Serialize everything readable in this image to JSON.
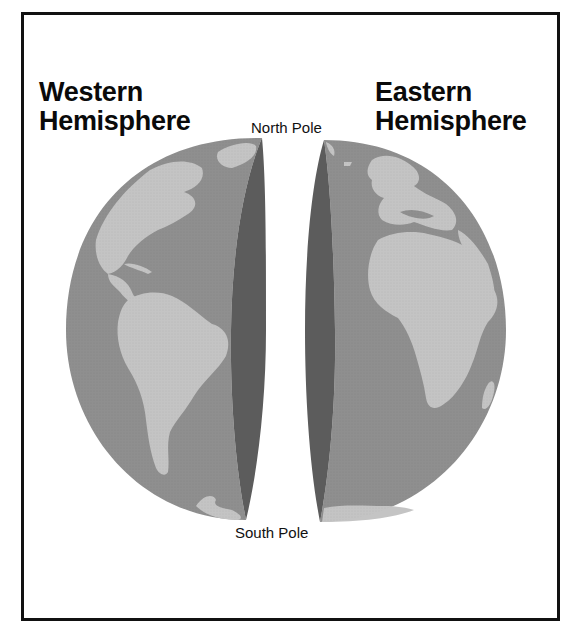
{
  "diagram": {
    "western": {
      "title_line1": "Western",
      "title_line2": "Hemisphere",
      "continents": [
        "North America",
        "South America",
        "Greenland",
        "Antarctica"
      ]
    },
    "eastern": {
      "title_line1": "Eastern",
      "title_line2": "Hemisphere",
      "continents": [
        "Europe",
        "Africa",
        "Antarctica"
      ]
    },
    "labels": {
      "north_pole": "North Pole",
      "south_pole": "South Pole"
    },
    "colors": {
      "ocean": "#8f8f8f",
      "land": "#c4c4c4",
      "cut_face": "#5c5c5c",
      "frame": "#111111",
      "text": "#0a0a0a"
    }
  }
}
